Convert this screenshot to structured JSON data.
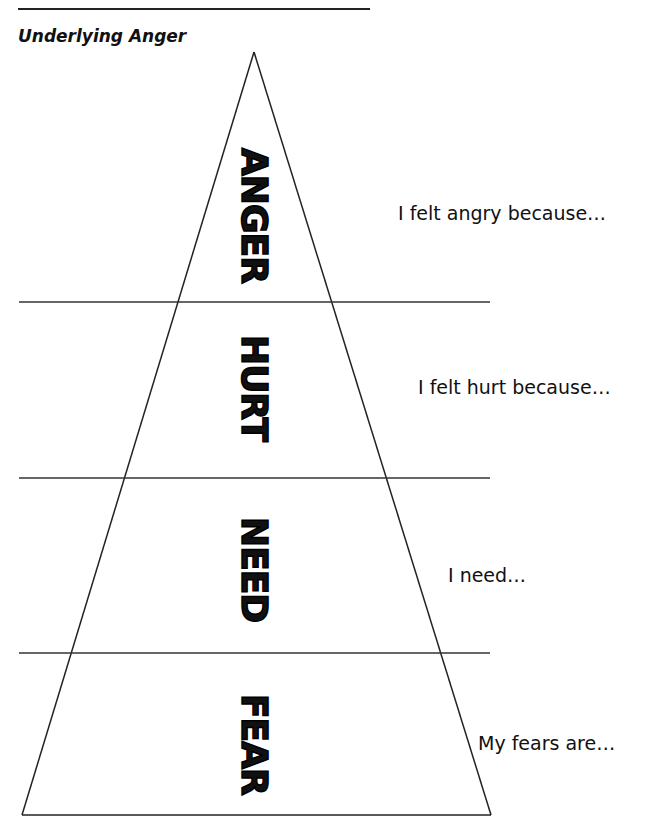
{
  "document": {
    "title": "Underlying Anger",
    "layers": [
      {
        "label": "ANGER",
        "prompt": "I felt angry because…"
      },
      {
        "label": "HURT",
        "prompt": "I felt hurt because…"
      },
      {
        "label": "NEED",
        "prompt": "I need…"
      },
      {
        "label": "FEAR",
        "prompt": "My fears are…"
      }
    ]
  }
}
